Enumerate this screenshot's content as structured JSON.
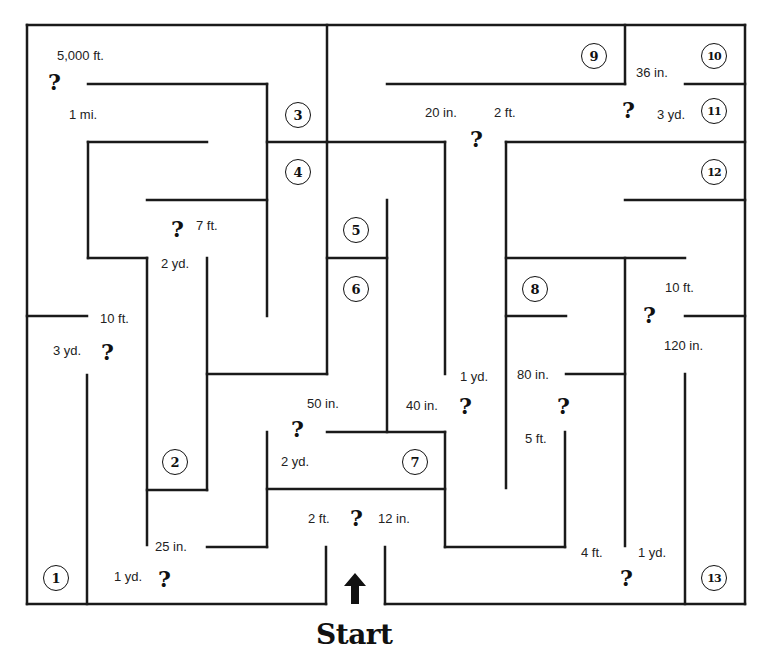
{
  "maze": {
    "stroke_color": "#1a1a1a",
    "start_label": "Start",
    "stations": [
      {
        "n": "1",
        "x": 43,
        "y": 565
      },
      {
        "n": "2",
        "x": 162,
        "y": 449
      },
      {
        "n": "3",
        "x": 285,
        "y": 102
      },
      {
        "n": "4",
        "x": 285,
        "y": 159
      },
      {
        "n": "5",
        "x": 343,
        "y": 217
      },
      {
        "n": "6",
        "x": 343,
        "y": 276
      },
      {
        "n": "7",
        "x": 402,
        "y": 449
      },
      {
        "n": "8",
        "x": 522,
        "y": 276
      },
      {
        "n": "9",
        "x": 581,
        "y": 43
      },
      {
        "n": "10",
        "x": 701,
        "y": 43
      },
      {
        "n": "11",
        "x": 701,
        "y": 98
      },
      {
        "n": "12",
        "x": 701,
        "y": 159
      },
      {
        "n": "13",
        "x": 701,
        "y": 565
      }
    ],
    "labels": [
      {
        "text": "5,000 ft.",
        "x": 57,
        "y": 48
      },
      {
        "text": "1 mi.",
        "x": 69,
        "y": 107
      },
      {
        "text": "20 in.",
        "x": 425,
        "y": 105
      },
      {
        "text": "2 ft.",
        "x": 494,
        "y": 105
      },
      {
        "text": "36 in.",
        "x": 636,
        "y": 65
      },
      {
        "text": "3 yd.",
        "x": 657,
        "y": 107
      },
      {
        "text": "7 ft.",
        "x": 196,
        "y": 218
      },
      {
        "text": "2 yd.",
        "x": 161,
        "y": 256
      },
      {
        "text": "10 ft.",
        "x": 100,
        "y": 311
      },
      {
        "text": "3 yd.",
        "x": 53,
        "y": 343
      },
      {
        "text": "10 ft.",
        "x": 665,
        "y": 280
      },
      {
        "text": "120 in.",
        "x": 664,
        "y": 338
      },
      {
        "text": "1 yd.",
        "x": 460,
        "y": 369
      },
      {
        "text": "80 in.",
        "x": 517,
        "y": 367
      },
      {
        "text": "50 in.",
        "x": 307,
        "y": 396
      },
      {
        "text": "40 in.",
        "x": 406,
        "y": 398
      },
      {
        "text": "5 ft.",
        "x": 525,
        "y": 431
      },
      {
        "text": "2 yd.",
        "x": 281,
        "y": 454
      },
      {
        "text": "2 ft.",
        "x": 308,
        "y": 511
      },
      {
        "text": "12 in.",
        "x": 378,
        "y": 511
      },
      {
        "text": "25 in.",
        "x": 155,
        "y": 539
      },
      {
        "text": "4 ft.",
        "x": 581,
        "y": 545
      },
      {
        "text": "1 yd.",
        "x": 638,
        "y": 545
      },
      {
        "text": "1 yd.",
        "x": 114,
        "y": 569
      }
    ],
    "question_marks": [
      {
        "x": 48,
        "y": 71
      },
      {
        "x": 470,
        "y": 128
      },
      {
        "x": 622,
        "y": 99
      },
      {
        "x": 171,
        "y": 218
      },
      {
        "x": 101,
        "y": 341
      },
      {
        "x": 643,
        "y": 304
      },
      {
        "x": 459,
        "y": 395
      },
      {
        "x": 557,
        "y": 395
      },
      {
        "x": 291,
        "y": 418
      },
      {
        "x": 350,
        "y": 507
      },
      {
        "x": 158,
        "y": 568
      },
      {
        "x": 620,
        "y": 567
      }
    ],
    "walls": [
      [
        27,
        25,
        745,
        25
      ],
      [
        27,
        25,
        27,
        604
      ],
      [
        27,
        604,
        326,
        604
      ],
      [
        385,
        604,
        745,
        604
      ],
      [
        745,
        25,
        745,
        604
      ],
      [
        327,
        25,
        327,
        142
      ],
      [
        625,
        25,
        625,
        84
      ],
      [
        387,
        84,
        625,
        84
      ],
      [
        685,
        84,
        745,
        84
      ],
      [
        88,
        84,
        267,
        84
      ],
      [
        267,
        84,
        267,
        316
      ],
      [
        267,
        142,
        445,
        142
      ],
      [
        445,
        142,
        445,
        374
      ],
      [
        88,
        142,
        207,
        142
      ],
      [
        88,
        142,
        88,
        258
      ],
      [
        88,
        258,
        147,
        258
      ],
      [
        147,
        258,
        147,
        545
      ],
      [
        147,
        200,
        267,
        200
      ],
      [
        27,
        316,
        87,
        316
      ],
      [
        87,
        375,
        87,
        604
      ],
      [
        207,
        258,
        207,
        490
      ],
      [
        147,
        490,
        207,
        490
      ],
      [
        207,
        374,
        327,
        374
      ],
      [
        327,
        142,
        327,
        374
      ],
      [
        327,
        258,
        387,
        258
      ],
      [
        387,
        200,
        387,
        432
      ],
      [
        327,
        432,
        445,
        432
      ],
      [
        445,
        432,
        445,
        547
      ],
      [
        267,
        489,
        445,
        489
      ],
      [
        267,
        432,
        267,
        547
      ],
      [
        207,
        547,
        267,
        547
      ],
      [
        326,
        547,
        326,
        604
      ],
      [
        385,
        547,
        385,
        604
      ],
      [
        445,
        547,
        565,
        547
      ],
      [
        565,
        432,
        565,
        547
      ],
      [
        506,
        142,
        745,
        142
      ],
      [
        506,
        142,
        506,
        488
      ],
      [
        625,
        200,
        745,
        200
      ],
      [
        506,
        258,
        685,
        258
      ],
      [
        625,
        258,
        625,
        546
      ],
      [
        506,
        316,
        566,
        316
      ],
      [
        566,
        374,
        625,
        374
      ],
      [
        685,
        316,
        745,
        316
      ],
      [
        685,
        374,
        685,
        604
      ]
    ]
  }
}
